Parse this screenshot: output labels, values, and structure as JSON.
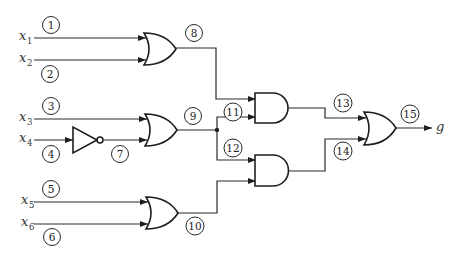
{
  "diagram": {
    "type": "logic-circuit",
    "inputs": [
      {
        "var": "x",
        "sub": "1",
        "line": "1"
      },
      {
        "var": "x",
        "sub": "2",
        "line": "2"
      },
      {
        "var": "x",
        "sub": "3",
        "line": "3"
      },
      {
        "var": "x",
        "sub": "4",
        "line": "4"
      },
      {
        "var": "x",
        "sub": "5",
        "line": "5"
      },
      {
        "var": "x",
        "sub": "6",
        "line": "6"
      }
    ],
    "line_labels": {
      "l7": "7",
      "l8": "8",
      "l9": "9",
      "l10": "10",
      "l11": "11",
      "l12": "12",
      "l13": "13",
      "l14": "14",
      "l15": "15"
    },
    "output": {
      "label": "g"
    },
    "gates": [
      {
        "id": "or1",
        "type": "OR",
        "inputs": [
          "1",
          "2"
        ],
        "output": "8"
      },
      {
        "id": "not1",
        "type": "NOT",
        "inputs": [
          "4"
        ],
        "output": "7"
      },
      {
        "id": "or2",
        "type": "OR",
        "inputs": [
          "3",
          "7"
        ],
        "output": "9"
      },
      {
        "id": "or3",
        "type": "OR",
        "inputs": [
          "5",
          "6"
        ],
        "output": "10"
      },
      {
        "id": "and1",
        "type": "AND",
        "inputs": [
          "8",
          "11"
        ],
        "output": "13"
      },
      {
        "id": "and2",
        "type": "AND",
        "inputs": [
          "12",
          "10"
        ],
        "output": "14"
      },
      {
        "id": "or4",
        "type": "OR",
        "inputs": [
          "13",
          "14"
        ],
        "output": "15"
      }
    ],
    "fanout": {
      "from": "9",
      "branches": [
        "11",
        "12"
      ]
    }
  }
}
